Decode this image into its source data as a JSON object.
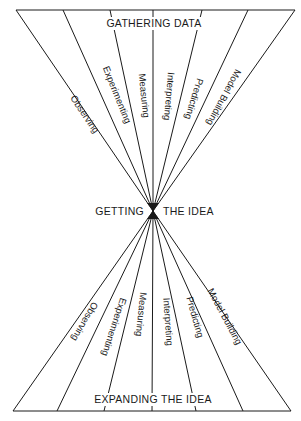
{
  "diagram": {
    "top_heading": "GATHERING DATA",
    "center_left": "GETTING",
    "center_right": "THE IDEA",
    "bottom_heading": "EXPANDING THE IDEA",
    "top_labels": [
      "Observing",
      "Experimenting",
      "Measuring",
      "Interpreting",
      "Predicting",
      "Model Building"
    ],
    "bottom_labels": [
      "Observing",
      "Experimenting",
      "Measuring",
      "Interpreting",
      "Predicting",
      "Model Building"
    ],
    "line_color": "#1a1a1a",
    "background": "#ffffff"
  }
}
